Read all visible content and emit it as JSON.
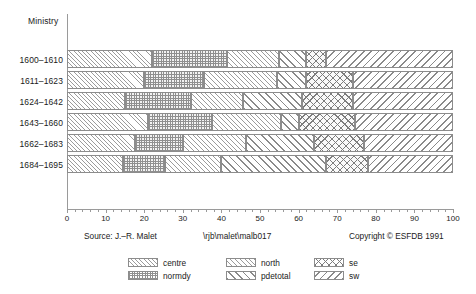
{
  "chart": {
    "y_axis_title": "Ministry",
    "footer": {
      "source": "Source: J.–R. Malet",
      "path": "\\rjb\\malet\\malb017",
      "copyright": "Copyright © ESFDB 1991"
    }
  },
  "chart_data": {
    "type": "bar",
    "orientation": "horizontal",
    "stacked": true,
    "title": "",
    "xlabel": "",
    "ylabel": "Ministry",
    "xlim": [
      0,
      100
    ],
    "ylim": [
      0,
      6
    ],
    "grid": false,
    "legend_position": "bottom",
    "xticks": [
      0,
      10,
      20,
      30,
      40,
      50,
      60,
      70,
      80,
      90,
      100
    ],
    "xticklabels": [
      "0",
      "10",
      "20",
      "30",
      "40",
      "50",
      "60",
      "70",
      "80",
      "90",
      "100"
    ],
    "categories": [
      "1600–1610",
      "1611–1623",
      "1624–1642",
      "1643–1660",
      "1662–1683",
      "1684–1695"
    ],
    "series": [
      {
        "name": "centre",
        "pattern": "fine-forward-hatch",
        "values": [
          22.0,
          20.0,
          15.0,
          21.0,
          17.5,
          14.5
        ]
      },
      {
        "name": "normdy",
        "pattern": "checker",
        "values": [
          19.5,
          15.5,
          17.0,
          16.5,
          12.5,
          11.0
        ]
      },
      {
        "name": "north",
        "pattern": "fine-forward-hatch2",
        "values": [
          13.5,
          19.0,
          13.5,
          18.0,
          16.5,
          14.5
        ]
      },
      {
        "name": "pdetotal",
        "pattern": "bold-forward-hatch",
        "values": [
          7.0,
          7.5,
          15.5,
          4.5,
          17.5,
          27.0
        ]
      },
      {
        "name": "se",
        "pattern": "cross-hatch",
        "values": [
          5.0,
          12.0,
          13.0,
          14.5,
          13.0,
          11.0
        ]
      },
      {
        "name": "sw",
        "pattern": "bold-back-hatch",
        "values": [
          33.0,
          26.0,
          26.0,
          25.5,
          23.0,
          22.0
        ]
      }
    ],
    "legend_entries": [
      {
        "label": "centre",
        "pattern": "fine-forward-hatch"
      },
      {
        "label": "normdy",
        "pattern": "checker"
      },
      {
        "label": "north",
        "pattern": "fine-forward-hatch2"
      },
      {
        "label": "pdetotal",
        "pattern": "bold-forward-hatch"
      },
      {
        "label": "se",
        "pattern": "cross-hatch"
      },
      {
        "label": "sw",
        "pattern": "bold-back-hatch"
      }
    ]
  },
  "colors": {
    "axis": "#9a9a9a",
    "segment_border": "#8c8c8c",
    "hatch": "#8f8f8f",
    "text": "#1a1a1a",
    "background": "#ffffff"
  }
}
